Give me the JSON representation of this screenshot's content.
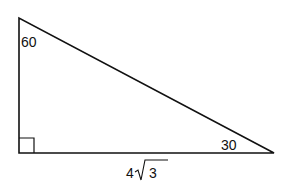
{
  "diagram": {
    "type": "right-triangle",
    "angles": {
      "top": "60",
      "bottom_right": "30",
      "bottom_left": "right-angle"
    },
    "sides": {
      "base": {
        "coefficient": "4",
        "radicand": "3"
      }
    },
    "colors": {
      "stroke": "#111111",
      "background": "#ffffff"
    }
  }
}
